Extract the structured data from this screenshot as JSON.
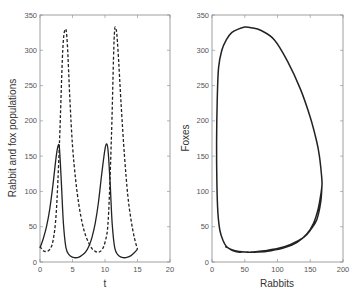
{
  "chart_data": [
    {
      "type": "line",
      "title": "",
      "xlabel": "t",
      "ylabel": "Rabbit and fox populations",
      "xlim": [
        0,
        20
      ],
      "ylim": [
        0,
        350
      ],
      "xticks": [
        "0",
        "5",
        "10",
        "15",
        "20"
      ],
      "yticks": [
        "0",
        "50",
        "100",
        "150",
        "200",
        "250",
        "300",
        "350"
      ],
      "grid": false,
      "legend": null,
      "series": [
        {
          "name": "Rabbits",
          "style": "solid",
          "x": [
            0,
            0.5,
            1,
            1.5,
            2,
            2.5,
            2.8,
            3.0,
            3.3,
            3.6,
            4,
            4.5,
            5,
            5.5,
            6,
            6.5,
            7,
            7.5,
            8,
            8.5,
            9,
            9.5,
            10,
            10.3,
            10.5,
            10.8,
            11.1,
            11.5,
            12,
            12.5,
            13,
            13.5,
            14,
            14.5,
            15
          ],
          "values": [
            20,
            33,
            50,
            75,
            110,
            150,
            165,
            160,
            110,
            55,
            20,
            10,
            7,
            6,
            7,
            10,
            14,
            22,
            35,
            55,
            85,
            125,
            160,
            167,
            155,
            110,
            55,
            20,
            10,
            7,
            6,
            7,
            9,
            13,
            18
          ]
        },
        {
          "name": "Foxes",
          "style": "dashed",
          "x": [
            0,
            0.5,
            1,
            1.5,
            2,
            2.5,
            3,
            3.5,
            3.9,
            4.2,
            4.6,
            5,
            5.5,
            6,
            6.5,
            7,
            7.5,
            8,
            8.5,
            9,
            9.5,
            10,
            10.5,
            11,
            11.4,
            11.7,
            12,
            12.5,
            13,
            13.5,
            14,
            14.5,
            15
          ],
          "values": [
            22,
            16,
            15,
            18,
            30,
            70,
            170,
            300,
            330,
            310,
            230,
            165,
            115,
            80,
            55,
            38,
            27,
            19,
            15,
            14,
            17,
            28,
            60,
            180,
            315,
            330,
            300,
            220,
            150,
            95,
            60,
            35,
            18
          ]
        }
      ]
    },
    {
      "type": "line",
      "title": "",
      "xlabel": "Rabbits",
      "ylabel": "Foxes",
      "xlim": [
        0,
        200
      ],
      "ylim": [
        0,
        350
      ],
      "xticks": [
        "0",
        "50",
        "100",
        "150",
        "200"
      ],
      "yticks": [
        "0",
        "50",
        "100",
        "150",
        "200",
        "250",
        "300",
        "350"
      ],
      "grid": false,
      "legend": null,
      "series": [
        {
          "name": "Phase portrait",
          "style": "solid",
          "x": [
            20,
            35,
            50,
            70,
            90,
            110,
            130,
            145,
            155,
            162,
            166,
            168,
            167,
            164,
            160,
            150,
            135,
            115,
            95,
            75,
            60,
            50,
            40,
            30,
            22,
            15,
            10,
            8,
            7,
            7.5,
            9,
            12,
            17,
            22,
            28,
            35,
            40,
            45,
            50,
            55,
            60,
            70,
            80,
            100,
            120,
            140,
            150,
            160,
            166,
            168
          ],
          "values": [
            22,
            16,
            14,
            14,
            16,
            20,
            28,
            40,
            55,
            75,
            95,
            110,
            125,
            150,
            170,
            205,
            245,
            285,
            315,
            328,
            332,
            333,
            330,
            325,
            315,
            300,
            275,
            230,
            170,
            110,
            70,
            45,
            30,
            22,
            18,
            15,
            14,
            14,
            14,
            14,
            14,
            15,
            16,
            19,
            25,
            35,
            45,
            60,
            85,
            110
          ]
        }
      ]
    }
  ],
  "left_plot": {
    "xlabel": "t",
    "ylabel": "Rabbit and fox populations",
    "xticks": [
      "0",
      "5",
      "10",
      "15",
      "20"
    ],
    "yticks": [
      "0",
      "50",
      "100",
      "150",
      "200",
      "250",
      "300",
      "350"
    ]
  },
  "right_plot": {
    "xlabel": "Rabbits",
    "ylabel": "Foxes",
    "xticks": [
      "0",
      "50",
      "100",
      "150",
      "200"
    ],
    "yticks": [
      "0",
      "50",
      "100",
      "150",
      "200",
      "250",
      "300",
      "350"
    ]
  }
}
